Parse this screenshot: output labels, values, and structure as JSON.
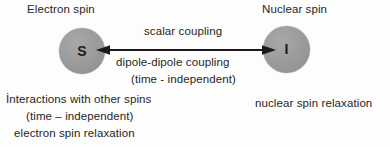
{
  "diagram": {
    "title_hidden": "",
    "background_color": "#fdfdfd",
    "sphere_color": "#9a9a9a",
    "text_color": "#262626",
    "nodes": [
      {
        "id": "electron-spin",
        "caption": "Electron spin",
        "letter": "S"
      },
      {
        "id": "nuclear-spin",
        "caption": "Nuclear spin",
        "letter": "I"
      }
    ],
    "connector": {
      "type": "double-headed-arrow",
      "labels_above": [
        "scalar coupling"
      ],
      "labels_below": [
        "dipole-dipole coupling",
        "(time - independent)"
      ]
    },
    "annotations": {
      "electron_side": [
        "İnteractions with other spins",
        "(time – independent)",
        "electron spin relaxation"
      ],
      "nuclear_side": [
        "nuclear spin relaxation"
      ]
    }
  }
}
